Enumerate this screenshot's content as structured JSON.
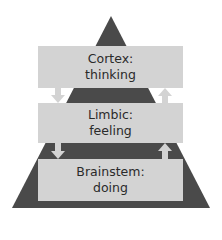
{
  "diagram": {
    "levels": [
      {
        "name": "Cortex:",
        "function": "thinking"
      },
      {
        "name": "Limbic:",
        "function": "feeling"
      },
      {
        "name": "Brainstem:",
        "function": "doing"
      }
    ],
    "arrows": {
      "left": "down",
      "right": "up"
    },
    "colors": {
      "pyramid": "#4a4a4a",
      "box": "#d3d3d3",
      "arrow": "#d3d3d3",
      "text": "#2a2a2a"
    }
  }
}
